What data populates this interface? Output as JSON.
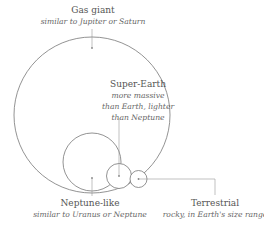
{
  "diagram": {
    "type": "planet-size-categories",
    "stroke_color": "#777777",
    "leader_color": "#999999",
    "categories": [
      {
        "id": "gas-giant",
        "title": "Gas giant",
        "description": "similar to Jupiter or Saturn",
        "circle": {
          "cx": 92,
          "cy": 115,
          "r": 78
        }
      },
      {
        "id": "super-earth",
        "title": "Super-Earth",
        "description_lines": [
          "more massive",
          "than Earth, lighter",
          "than Neptune"
        ],
        "circle": {
          "cx": 119,
          "cy": 176,
          "r": 12.5
        }
      },
      {
        "id": "neptune-like",
        "title": "Neptune-like",
        "description": "similar to Uranus or Neptune",
        "circle": {
          "cx": 92,
          "cy": 162,
          "r": 29
        }
      },
      {
        "id": "terrestrial",
        "title": "Terrestrial",
        "description": "rocky, in Earth's size range",
        "circle": {
          "cx": 138.5,
          "cy": 179,
          "r": 8.5
        }
      }
    ]
  }
}
